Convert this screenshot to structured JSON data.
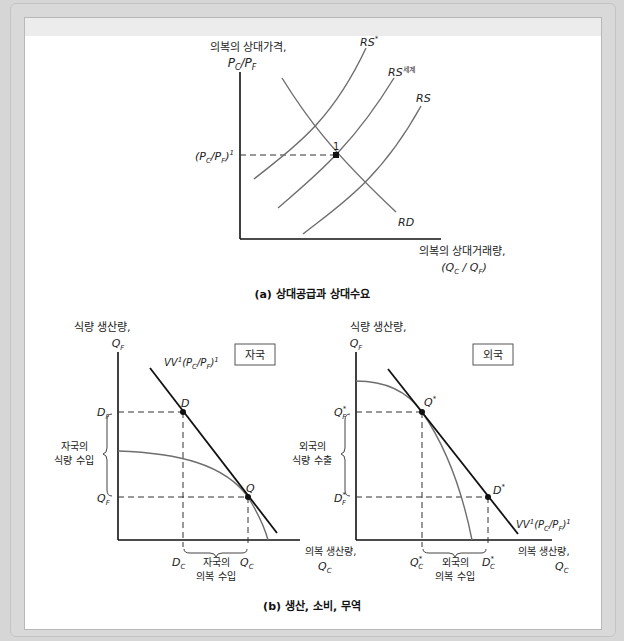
{
  "panel_a": {
    "caption": "(a) 상대공급과 상대수요",
    "y_axis_label_line1": "의복의 상대가격,",
    "y_axis_label_line2": "PC/PF",
    "x_axis_label_line1": "의복의 상대거래량,",
    "x_axis_label_line2": "(QC / QF)",
    "price_level_label": "(PC/PF)1",
    "equilibrium_point_label": "1",
    "curves": {
      "rs_star": "RS*",
      "rs_world": "RS",
      "rs_world_sup": "세계",
      "rs": "RS",
      "rd": "RD"
    }
  },
  "panel_b": {
    "caption": "(b) 생산, 소비, 무역",
    "home": {
      "title": "자국",
      "y_axis_label_line1": "식량 생산량,",
      "y_axis_label_line2": "QF",
      "x_axis_label_line1": "의복 생산량,",
      "x_axis_label_line2": "QC",
      "budget_line_label": "VV1(PC/PF)1",
      "points": {
        "consumption": "D",
        "production": "Q"
      },
      "y_ticks": {
        "upper": "DF",
        "lower": "QF"
      },
      "x_ticks": {
        "left": "DC",
        "right": "QC"
      },
      "y_bracket_line1": "자국의",
      "y_bracket_line2": "식량 수입",
      "x_bracket_line1": "자국의",
      "x_bracket_line2": "의복 수입"
    },
    "foreign": {
      "title": "외국",
      "y_axis_label_line1": "식량 생산량,",
      "y_axis_label_line2": "QF",
      "x_axis_label_line1": "의복 생산량,",
      "x_axis_label_line2": "QC",
      "budget_line_label": "VV1(PC/PF)1",
      "points": {
        "production": "Q*",
        "consumption": "D*"
      },
      "y_ticks": {
        "upper": "Q*F",
        "lower": "D*F"
      },
      "x_ticks": {
        "left": "Q*C",
        "right": "D*C"
      },
      "y_bracket_line1": "외국의",
      "y_bracket_line2": "식량 수출",
      "x_bracket_line1": "외국의",
      "x_bracket_line2": "의복 수입"
    }
  },
  "colors": {
    "axis": "#111111",
    "curve_gray": "#6e6e6e",
    "dash": "#333333",
    "background": "#ffffff",
    "frame": "#d6d6d6"
  }
}
